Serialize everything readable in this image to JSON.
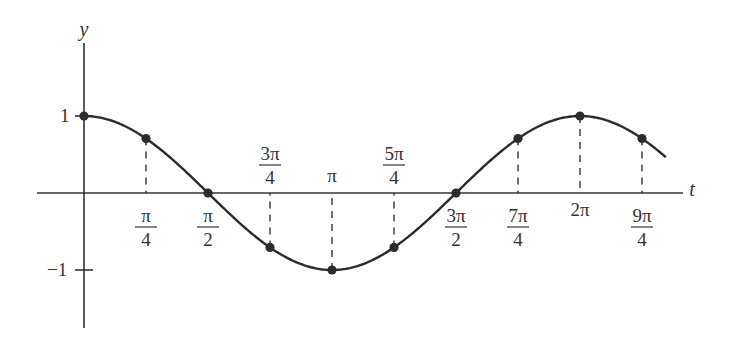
{
  "chart_data": {
    "type": "line",
    "title": "",
    "function": "y = cos(t)",
    "xlabel": "t",
    "ylabel": "y",
    "xlim": [
      -0.75,
      7.6
    ],
    "ylim": [
      -1.7,
      1.95
    ],
    "grid": false,
    "legend": null,
    "y_ticks": [
      {
        "value": 1,
        "label": "1"
      },
      {
        "value": -1,
        "label": "−1"
      }
    ],
    "x_ticks": [
      {
        "value": 0.7854,
        "num": "π",
        "den": "4",
        "label_pos": "below"
      },
      {
        "value": 1.5708,
        "num": "π",
        "den": "2",
        "label_pos": "below"
      },
      {
        "value": 2.3562,
        "num": "3π",
        "den": "4",
        "label_pos": "above"
      },
      {
        "value": 3.1416,
        "num": "π",
        "den": "",
        "label_pos": "above"
      },
      {
        "value": 3.927,
        "num": "5π",
        "den": "4",
        "label_pos": "above"
      },
      {
        "value": 4.7124,
        "num": "3π",
        "den": "2",
        "label_pos": "below"
      },
      {
        "value": 5.4978,
        "num": "7π",
        "den": "4",
        "label_pos": "below"
      },
      {
        "value": 6.2832,
        "num": "2π",
        "den": "",
        "label_pos": "below"
      },
      {
        "value": 7.0686,
        "num": "9π",
        "den": "4",
        "label_pos": "below"
      }
    ],
    "x": [
      0,
      0.7854,
      1.5708,
      2.3562,
      3.1416,
      3.927,
      4.7124,
      5.4978,
      6.2832,
      7.0686
    ],
    "points": [
      {
        "t": "0",
        "y": 1
      },
      {
        "t": "π/4",
        "y": 0.707
      },
      {
        "t": "π/2",
        "y": 0
      },
      {
        "t": "3π/4",
        "y": -0.707
      },
      {
        "t": "π",
        "y": -1
      },
      {
        "t": "5π/4",
        "y": -0.707
      },
      {
        "t": "3π/2",
        "y": 0
      },
      {
        "t": "7π/4",
        "y": 0.707
      },
      {
        "t": "2π",
        "y": 1
      },
      {
        "t": "9π/4",
        "y": 0.707
      }
    ],
    "curve_range": [
      0,
      7.37
    ],
    "dashed_guides": true
  }
}
